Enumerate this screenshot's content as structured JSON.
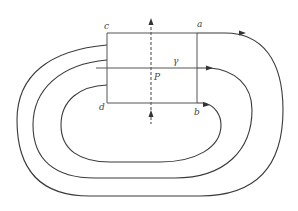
{
  "diagram": {
    "type": "field-lines-through-rectangular-surface",
    "labels": {
      "corner_top_left": "c",
      "corner_top_right": "a",
      "corner_bottom_left": "d",
      "corner_bottom_right": "b",
      "curve_label": "γ",
      "point_label": "P"
    },
    "colors": {
      "line": "#3a3a3a",
      "label": "#444444",
      "background": "#ffffff"
    },
    "elements": [
      {
        "id": "rectangle",
        "description": "rectangle abcd with corners c (top-left), a (top-right), d (bottom-left), b (bottom-right)"
      },
      {
        "id": "dashed-axis",
        "description": "vertical dashed line through P with upward arrows at top and bottom"
      },
      {
        "id": "curve-gamma",
        "description": "horizontal line γ passing through P, continuing as a closed loop"
      },
      {
        "id": "outer-loop",
        "description": "closed loop leaving from corner a, arrow pointing right"
      },
      {
        "id": "middle-loop",
        "description": "closed loop along γ, arrow pointing right"
      },
      {
        "id": "inner-loop",
        "description": "closed loop leaving from corner b, arrow pointing right"
      }
    ]
  }
}
